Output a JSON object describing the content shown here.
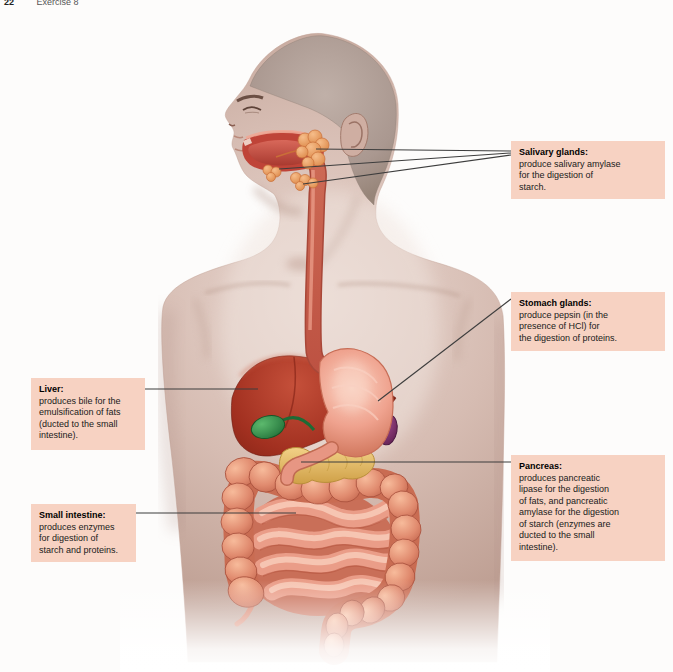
{
  "page": {
    "number": "22",
    "section_header": "Exercise 8"
  },
  "callouts": {
    "salivary_glands": {
      "title": "Salivary glands:",
      "body": "produce salivary amylase\nfor the digestion of\nstarch."
    },
    "stomach_glands": {
      "title": "Stomach glands:",
      "body": "produce pepsin (in the\npresence of HCl) for\nthe digestion of proteins."
    },
    "liver": {
      "title": "Liver:",
      "body": "produces bile for the\nemulsification of fats\n(ducted to the small\nintestine)."
    },
    "pancreas": {
      "title": "Pancreas:",
      "body": "produces pancreatic\nlipase for the digestion\nof fats, and pancreatic\namylase for the digestion\nof starch (enzymes are\nducted to the small\nintestine)."
    },
    "small_intestine": {
      "title": "Small intestine:",
      "body": "produces enzymes\nfor digestion of\nstarch and proteins."
    }
  },
  "colors": {
    "callout_bg": "#f7d2c2",
    "leader_line": "#3d3d3d",
    "skin": "#d6bab0",
    "liver": "#a1301f",
    "gallbladder": "#2e9149",
    "stomach": "#efa28e",
    "spleen": "#8e3277",
    "pancreas": "#ecc167",
    "large_intestine": "#dd8168",
    "small_intestine": "#ea9d88",
    "salivary_glands": "#eda366",
    "esophagus": "#c75b49"
  }
}
